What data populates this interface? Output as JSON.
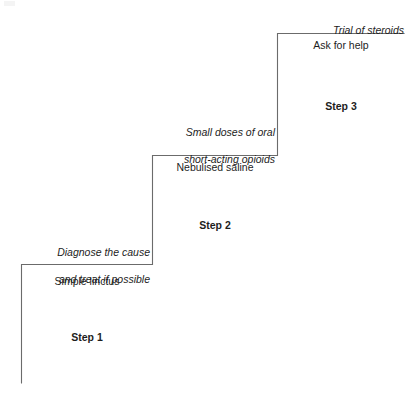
{
  "diagram": {
    "type": "staircase",
    "line_color": "#6b6b6b",
    "text_color": "#1d1d1d",
    "background_color": "#ffffff",
    "steps": [
      {
        "id": "step-1",
        "step_label": "Step 1",
        "italic_note": "Diagnose the cause\nand treat if possible",
        "italic_note_line1": "Diagnose the cause",
        "italic_note_line2": "and treat if possible",
        "treatment": "Simple linctus"
      },
      {
        "id": "step-2",
        "step_label": "Step 2",
        "italic_note": "Small doses of oral\nshort-acting opioids",
        "italic_note_line1": "Small doses of oral",
        "italic_note_line2": "short-acting opioids",
        "treatment": "Nebulised saline"
      },
      {
        "id": "step-3",
        "step_label": "Step 3",
        "italic_note": "Trial of steroids",
        "italic_note_line1": "Trial of steroids",
        "italic_note_line2": "",
        "treatment": "Ask for help"
      }
    ]
  }
}
